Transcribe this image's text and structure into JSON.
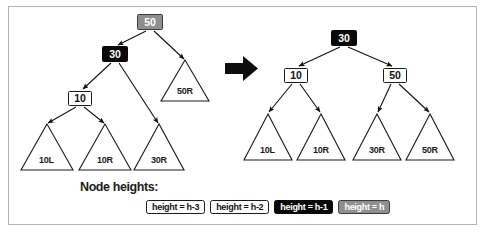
{
  "figure": {
    "name": "avl-tree-rotation-diagram",
    "border_color": "#b4b4b4",
    "background": "#ffffff"
  },
  "transition": {
    "arrow_icon": "right-arrow-icon",
    "color": "#0d0d0d"
  },
  "legend": {
    "title": "Node heights:",
    "chips": [
      {
        "label": "height = h-3",
        "style": "plain",
        "bg": "#ffffff",
        "fg": "#111111"
      },
      {
        "label": "height = h-2",
        "style": "plain",
        "bg": "#ffffff",
        "fg": "#111111"
      },
      {
        "label": "height = h-1",
        "style": "black",
        "bg": "#090909",
        "fg": "#ffffff"
      },
      {
        "label": "height = h",
        "style": "gray",
        "bg": "#8f8f8f",
        "fg": "#ffffff"
      }
    ]
  },
  "trees": [
    {
      "id": "before",
      "name": "tree-before-rotation",
      "nodes": [
        {
          "id": "l-50",
          "label": "50",
          "style": "gray",
          "x": 137,
          "y": 14,
          "w": 26,
          "h": 16
        },
        {
          "id": "l-30",
          "label": "30",
          "style": "black",
          "x": 102,
          "y": 46,
          "w": 26,
          "h": 16
        },
        {
          "id": "l-10",
          "label": "10",
          "style": "plain",
          "x": 68,
          "y": 91,
          "w": 24,
          "h": 15
        }
      ],
      "subtrees": [
        {
          "id": "l-50R",
          "label": "50R",
          "cx": 185,
          "apex_y": 60,
          "base_y": 101,
          "half": 24
        },
        {
          "id": "l-10L",
          "label": "10L",
          "cx": 47,
          "apex_y": 124,
          "base_y": 170,
          "half": 26
        },
        {
          "id": "l-10R",
          "label": "10R",
          "cx": 105,
          "apex_y": 124,
          "base_y": 170,
          "half": 26
        },
        {
          "id": "l-30R",
          "label": "30R",
          "cx": 159,
          "apex_y": 124,
          "base_y": 170,
          "half": 25
        }
      ],
      "edges": [
        {
          "from": "l-50",
          "to": "l-30",
          "x1": 146,
          "y1": 31,
          "x2": 118,
          "y2": 45
        },
        {
          "from": "l-50",
          "to": "l-50R",
          "x1": 154,
          "y1": 31,
          "x2": 184,
          "y2": 59
        },
        {
          "from": "l-30",
          "to": "l-10",
          "x1": 111,
          "y1": 63,
          "x2": 83,
          "y2": 89
        },
        {
          "from": "l-30",
          "to": "l-30R",
          "x1": 119,
          "y1": 63,
          "x2": 158,
          "y2": 123
        },
        {
          "from": "l-10",
          "to": "l-10L",
          "x1": 76,
          "y1": 107,
          "x2": 48,
          "y2": 123
        },
        {
          "from": "l-10",
          "to": "l-10R",
          "x1": 84,
          "y1": 107,
          "x2": 104,
          "y2": 123
        }
      ]
    },
    {
      "id": "after",
      "name": "tree-after-rotation",
      "nodes": [
        {
          "id": "r-30",
          "label": "30",
          "style": "black",
          "x": 331,
          "y": 30,
          "w": 26,
          "h": 16
        },
        {
          "id": "r-10",
          "label": "10",
          "style": "plain",
          "x": 284,
          "y": 68,
          "w": 24,
          "h": 15
        },
        {
          "id": "r-50",
          "label": "50",
          "style": "plain",
          "x": 383,
          "y": 68,
          "w": 24,
          "h": 15
        }
      ],
      "subtrees": [
        {
          "id": "r-10L",
          "label": "10L",
          "cx": 268,
          "apex_y": 114,
          "base_y": 160,
          "half": 24
        },
        {
          "id": "r-10R",
          "label": "10R",
          "cx": 321,
          "apex_y": 114,
          "base_y": 160,
          "half": 24
        },
        {
          "id": "r-30R",
          "label": "30R",
          "cx": 377,
          "apex_y": 114,
          "base_y": 160,
          "half": 24
        },
        {
          "id": "r-50R",
          "label": "50R",
          "cx": 430,
          "apex_y": 114,
          "base_y": 160,
          "half": 24
        }
      ],
      "edges": [
        {
          "from": "r-30",
          "to": "r-10",
          "x1": 340,
          "y1": 47,
          "x2": 299,
          "y2": 66
        },
        {
          "from": "r-30",
          "to": "r-50",
          "x1": 348,
          "y1": 47,
          "x2": 392,
          "y2": 66
        },
        {
          "from": "r-10",
          "to": "r-10L",
          "x1": 292,
          "y1": 84,
          "x2": 269,
          "y2": 112
        },
        {
          "from": "r-10",
          "to": "r-10R",
          "x1": 300,
          "y1": 84,
          "x2": 320,
          "y2": 112
        },
        {
          "from": "r-50",
          "to": "r-30R",
          "x1": 391,
          "y1": 84,
          "x2": 378,
          "y2": 112
        },
        {
          "from": "r-50",
          "to": "r-50R",
          "x1": 399,
          "y1": 84,
          "x2": 429,
          "y2": 112
        }
      ]
    }
  ]
}
